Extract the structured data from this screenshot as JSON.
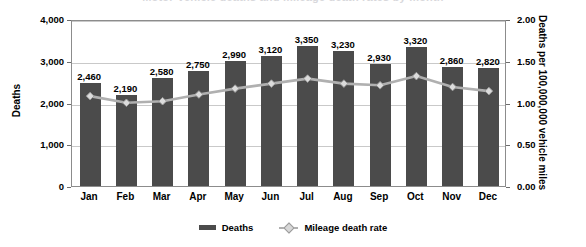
{
  "chart_data": {
    "type": "bar",
    "title": "Motor-vehicle deaths and mileage death rates by month",
    "categories": [
      "Jan",
      "Feb",
      "Mar",
      "Apr",
      "May",
      "Jun",
      "Jul",
      "Aug",
      "Sep",
      "Oct",
      "Nov",
      "Dec"
    ],
    "series": [
      {
        "name": "Deaths",
        "type": "bar",
        "axis": "left",
        "values": [
          2460,
          2190,
          2580,
          2750,
          2990,
          3120,
          3350,
          3230,
          2930,
          3320,
          2860,
          2820
        ],
        "labels": [
          "2,460",
          "2,190",
          "2,580",
          "2,750",
          "2,990",
          "3,120",
          "3,350",
          "3,230",
          "2,930",
          "3,320",
          "2,860",
          "2,820"
        ],
        "color": "#4b4b4b"
      },
      {
        "name": "Mileage death rate",
        "type": "line",
        "axis": "right",
        "values": [
          1.1,
          1.02,
          1.04,
          1.12,
          1.19,
          1.25,
          1.31,
          1.25,
          1.23,
          1.34,
          1.21,
          1.16
        ],
        "color": "#b0b0b0",
        "marker": "diamond"
      }
    ],
    "xlabel": "",
    "ylabel": "Deaths",
    "ylabel_right": "Deaths per 100,000,000 vehicle miles",
    "ylim": [
      0,
      4000
    ],
    "ylim_right": [
      0.0,
      2.0
    ],
    "yticks": [
      0,
      1000,
      2000,
      3000,
      4000
    ],
    "ytick_labels": [
      "0",
      "1,000",
      "2,000",
      "3,000",
      "4,000"
    ],
    "ytick_labels_right": [
      "0.00",
      "0.50",
      "1.00",
      "1.50",
      "2.00"
    ],
    "grid": true,
    "legend_position": "bottom"
  },
  "legend": {
    "items": [
      {
        "label": "Deaths",
        "marker": "bar-swatch"
      },
      {
        "label": "Mileage death rate",
        "marker": "line-diamond-swatch"
      }
    ]
  }
}
